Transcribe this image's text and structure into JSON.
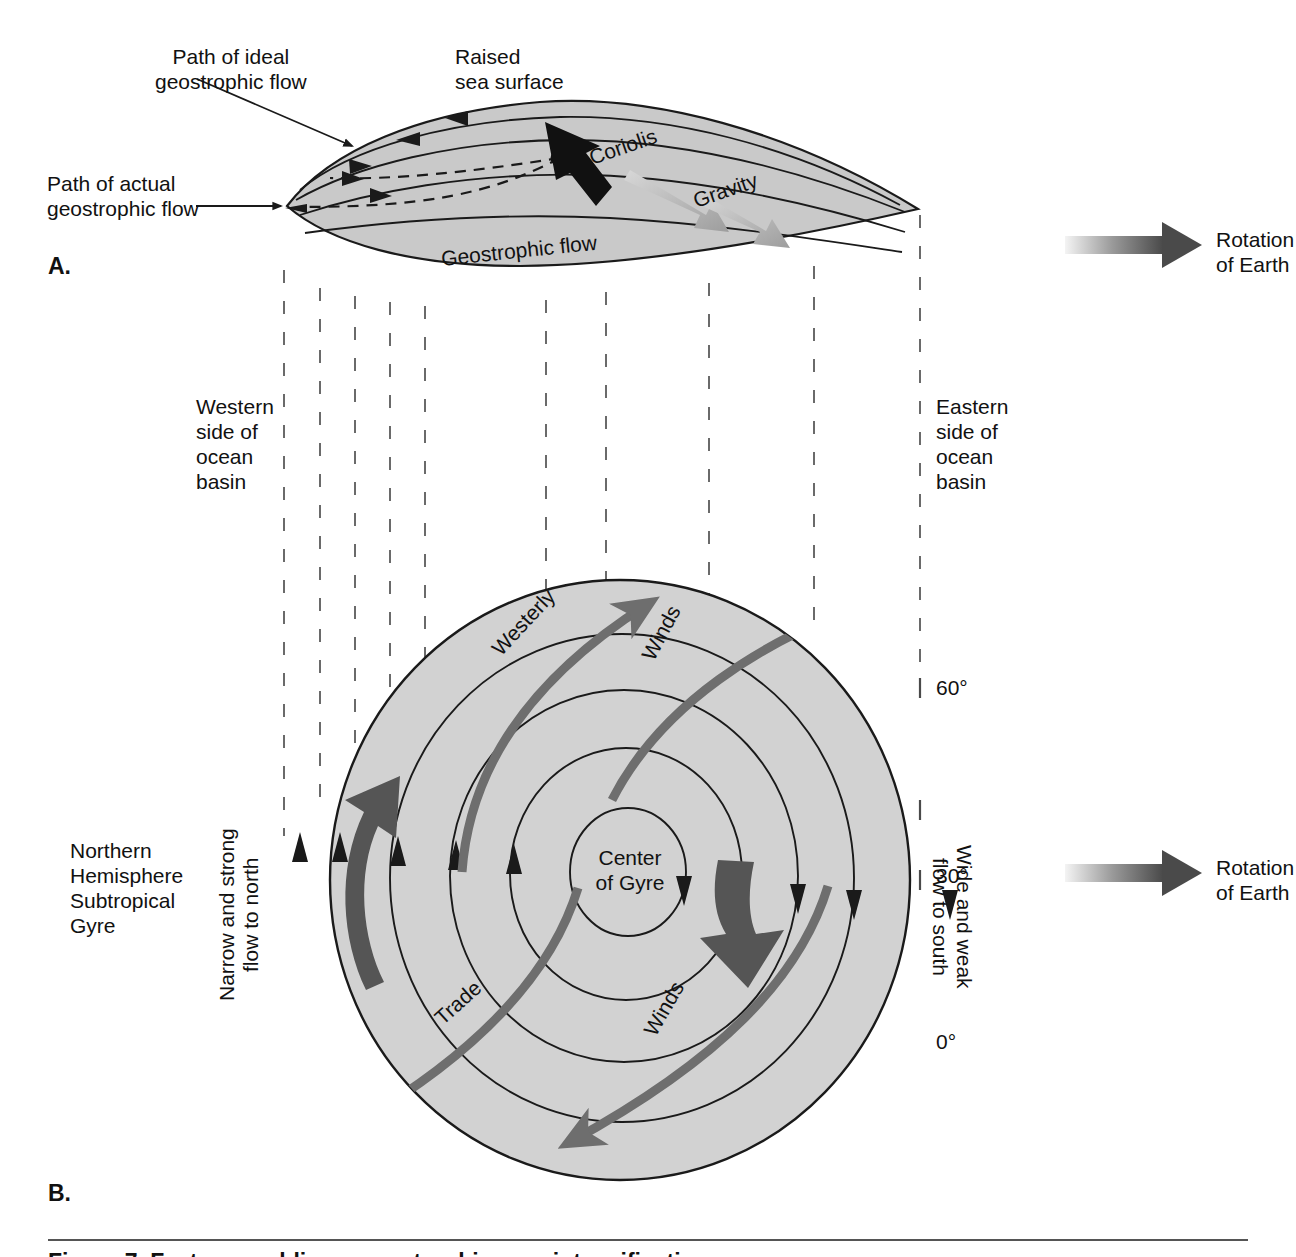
{
  "figure": {
    "background": "#ffffff",
    "panels": [
      {
        "letter": "A.",
        "name": "geostrophic-flow-cross-section"
      },
      {
        "letter": "B.",
        "name": "subtropical-gyre-plan-view"
      }
    ]
  },
  "colors": {
    "gyre_fill": "#d2d2d2",
    "sea_surface_fill": "#c9c9c9",
    "line": "#1a1a1a",
    "wind_arrow": "#6e6e6e",
    "boundary_current_arrow": "#555555",
    "coriolis_arrow": "#111111",
    "gravity_arrow": "#a8a8a8",
    "rotation_gradient_from": "#f2f2f2",
    "rotation_gradient_to": "#4a4a4a",
    "caption_rule": "#555555"
  },
  "panel_a": {
    "letter": "A.",
    "labels": {
      "ideal_path": "Path of ideal\ngeostrophic flow",
      "actual_path": "Path of actual\ngeostrophic flow",
      "raised_sea_surface": "Raised\nsea surface",
      "coriolis": "Coriolis",
      "gravity": "Gravity",
      "geostrophic_flow": "Geostrophic flow"
    }
  },
  "panel_b": {
    "letter": "B.",
    "labels": {
      "western_side": "Western\nside of\nocean\nbasin",
      "eastern_side": "Eastern\nside of\nocean\nbasin",
      "gyre_title": "Northern\nHemisphere\nSubtropical\nGyre",
      "narrow_strong": "Narrow and strong\nflow to north",
      "wide_weak": "Wide and weak\nflow to south",
      "center_of_gyre": "Center\nof Gyre",
      "westerly": "Westerly",
      "westerly_winds": "Winds",
      "trade": "Trade",
      "trade_winds": "Winds"
    },
    "latitudes": [
      {
        "value": "60°",
        "name": "latitude-60"
      },
      {
        "value": "30°",
        "name": "latitude-30"
      },
      {
        "value": "0°",
        "name": "latitude-0"
      }
    ]
  },
  "legends": [
    {
      "name": "rotation-legend-top",
      "label": "Rotation\nof Earth"
    },
    {
      "name": "rotation-legend-bottom",
      "label": "Rotation\nof Earth"
    }
  ],
  "caption": {
    "text": "Figure 7  Factors enabling a geostrophic gyre intensification"
  }
}
